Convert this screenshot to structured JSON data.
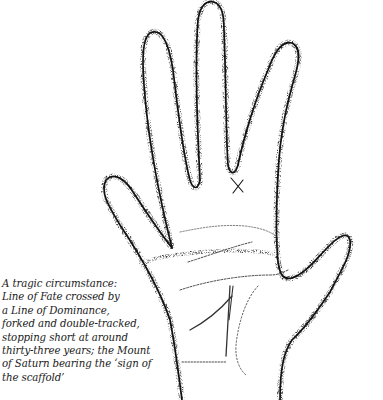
{
  "figure": {
    "markings": [
      "sign-of-the-scaffold-cross",
      "line-of-fate-forked",
      "line-of-dominance",
      "heart-line",
      "head-line",
      "life-line"
    ],
    "caption_lines": [
      "A tragic circumstance:",
      "Line of Fate crossed by",
      "a Line of Dominance,",
      "forked and double-tracked,",
      "stopping short at around",
      "thirty-three years; the Mount",
      "of Saturn bearing the ‘sign of",
      "the scaffold’"
    ]
  },
  "colors": {
    "ink": "#1a1a1a",
    "paper": "#ffffff"
  }
}
